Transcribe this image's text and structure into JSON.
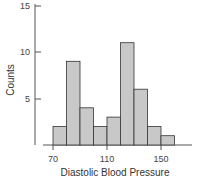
{
  "chart_data": {
    "type": "bar",
    "title": "",
    "xlabel": "Diastolic Blood Pressure",
    "ylabel": "Counts",
    "bins": [
      [
        70,
        80
      ],
      [
        80,
        90
      ],
      [
        90,
        100
      ],
      [
        100,
        110
      ],
      [
        110,
        120
      ],
      [
        120,
        130
      ],
      [
        130,
        140
      ],
      [
        140,
        150
      ],
      [
        150,
        160
      ]
    ],
    "categories": [
      "70-80",
      "80-90",
      "90-100",
      "100-110",
      "110-120",
      "120-130",
      "130-140",
      "140-150",
      "150-160"
    ],
    "values": [
      2,
      9,
      4,
      2,
      3,
      11,
      6,
      2,
      1
    ],
    "xticks": [
      70,
      110,
      150
    ],
    "yticks": [
      5,
      10,
      15
    ],
    "xlim": [
      70,
      160
    ],
    "ylim": [
      0,
      15
    ],
    "grid": false,
    "legend": null
  },
  "labels": {
    "xlabel": "Diastolic Blood Pressure",
    "ylabel": "Counts",
    "xtick_70": "70",
    "xtick_110": "110",
    "xtick_150": "150",
    "ytick_5": "5",
    "ytick_10": "10",
    "ytick_15": "15"
  },
  "colors": {
    "bar_fill": "#c8c8c8",
    "bar_stroke": "#333333",
    "axis": "#555555"
  }
}
